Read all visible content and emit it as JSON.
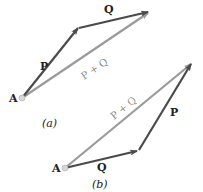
{
  "figure": {
    "colors": {
      "vector_dark": "#4a4a4a",
      "vector_sum": "#9a9a9a",
      "point": "#c8c8c8",
      "text": "#222222"
    },
    "panel_a": {
      "caption": "(a)",
      "origin_label": "A",
      "vector_p_label": "P",
      "vector_q_label": "Q",
      "resultant_label": "P + Q"
    },
    "panel_b": {
      "caption": "(b)",
      "origin_label": "A",
      "vector_p_label": "P",
      "vector_q_label": "Q",
      "resultant_label": "P + Q"
    }
  }
}
